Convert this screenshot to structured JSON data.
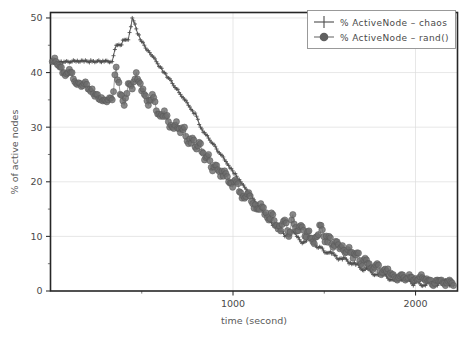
{
  "chart_data": {
    "type": "line",
    "title": "",
    "xlabel": "time (second)",
    "ylabel": "% of active nodes",
    "xlim": [
      0,
      2230
    ],
    "ylim": [
      0,
      51
    ],
    "xticks": [
      1000,
      2000
    ],
    "xticklabels": [
      "1000",
      "2000"
    ],
    "xminorticks": [
      500,
      1500
    ],
    "yticks": [
      0,
      10,
      20,
      30,
      40,
      50
    ],
    "yticklabels": [
      "0",
      "10",
      "20",
      "30",
      "40",
      "50"
    ],
    "yminorticks": [
      5,
      15,
      25,
      35,
      45
    ],
    "grid": true,
    "legend_position": "top-right",
    "series": [
      {
        "name": "% ActiveNode - chaos",
        "marker": "plus",
        "color": "#4c4c4c",
        "x": [
          10,
          30,
          52,
          74,
          96,
          118,
          140,
          162,
          184,
          206,
          228,
          250,
          272,
          294,
          316,
          338,
          360,
          382,
          404,
          426,
          448,
          470,
          492,
          514,
          536,
          558,
          580,
          602,
          624,
          646,
          668,
          690,
          712,
          734,
          756,
          778,
          800,
          822,
          844,
          866,
          888,
          910,
          932,
          954,
          976,
          998,
          1020,
          1042,
          1064,
          1086,
          1108,
          1130,
          1152,
          1174,
          1196,
          1218,
          1240,
          1262,
          1284,
          1306,
          1328,
          1350,
          1372,
          1394,
          1416,
          1438,
          1460,
          1482,
          1504,
          1526,
          1548,
          1570,
          1592,
          1614,
          1636,
          1658,
          1680,
          1702,
          1724,
          1746,
          1768,
          1790,
          1812,
          1834,
          1856,
          1878,
          1900,
          1922,
          1944,
          1966,
          1988,
          2010,
          2032,
          2054,
          2076,
          2098,
          2120,
          2142,
          2164,
          2186,
          2208
        ],
        "y": [
          42,
          42,
          42,
          42,
          42,
          42,
          42,
          42,
          42,
          42,
          42,
          42,
          42,
          42,
          42,
          42,
          45,
          45,
          46,
          46,
          50,
          48,
          46,
          45,
          44,
          43,
          42,
          41,
          40,
          39,
          38,
          37,
          36,
          35,
          34,
          33,
          32,
          30,
          29,
          28,
          27,
          26,
          25,
          24,
          23,
          22,
          21,
          20,
          19,
          18,
          17,
          16,
          15,
          14,
          13,
          12,
          12,
          11,
          10,
          10,
          11,
          10,
          9,
          9,
          10,
          9,
          8,
          8,
          7,
          7,
          7,
          6,
          6,
          6,
          5,
          5,
          5,
          4,
          4,
          4,
          3,
          3,
          3,
          3,
          2,
          2,
          2,
          2,
          2,
          2,
          1,
          2,
          1,
          1,
          2,
          1,
          1,
          2,
          2,
          1,
          1
        ]
      },
      {
        "name": "% ActiveNode - rand()",
        "marker": "circle",
        "color": "#6e6e6e",
        "x": [
          10,
          30,
          52,
          74,
          96,
          118,
          140,
          162,
          184,
          206,
          228,
          250,
          272,
          294,
          316,
          338,
          360,
          382,
          404,
          426,
          448,
          470,
          492,
          514,
          536,
          558,
          580,
          602,
          624,
          646,
          668,
          690,
          712,
          734,
          756,
          778,
          800,
          822,
          844,
          866,
          888,
          910,
          932,
          954,
          976,
          998,
          1020,
          1042,
          1064,
          1086,
          1108,
          1130,
          1152,
          1174,
          1196,
          1218,
          1240,
          1262,
          1284,
          1306,
          1328,
          1350,
          1372,
          1394,
          1416,
          1438,
          1460,
          1482,
          1504,
          1526,
          1548,
          1570,
          1592,
          1614,
          1636,
          1658,
          1680,
          1702,
          1724,
          1746,
          1768,
          1790,
          1812,
          1834,
          1856,
          1878,
          1900,
          1922,
          1944,
          1966,
          1988,
          2010,
          2032,
          2054,
          2076,
          2098,
          2120,
          2142,
          2164,
          2186,
          2208
        ],
        "y": [
          42,
          42,
          41,
          40,
          40,
          40,
          38,
          38,
          38,
          37,
          37,
          36,
          35,
          35,
          35,
          35,
          41,
          36,
          34,
          38,
          37,
          40,
          38,
          36,
          34,
          36,
          33,
          32,
          33,
          31,
          30,
          31,
          29,
          30,
          27,
          28,
          26,
          27,
          24,
          25,
          22,
          23,
          21,
          22,
          20,
          19,
          20,
          18,
          17,
          18,
          16,
          15,
          16,
          14,
          13,
          14,
          12,
          11,
          13,
          10,
          14,
          11,
          12,
          10,
          11,
          9,
          10,
          12,
          9,
          10,
          8,
          9,
          8,
          7,
          8,
          6,
          7,
          5,
          6,
          5,
          4,
          5,
          3,
          4,
          3,
          3,
          2,
          3,
          2,
          3,
          2,
          2,
          3,
          2,
          2,
          1,
          2,
          2,
          1,
          2,
          1
        ]
      }
    ]
  },
  "legend": {
    "entries": [
      {
        "label": "% ActiveNode – chaos",
        "marker": "plus"
      },
      {
        "label": "% ActiveNode – rand()",
        "marker": "circle"
      }
    ]
  }
}
